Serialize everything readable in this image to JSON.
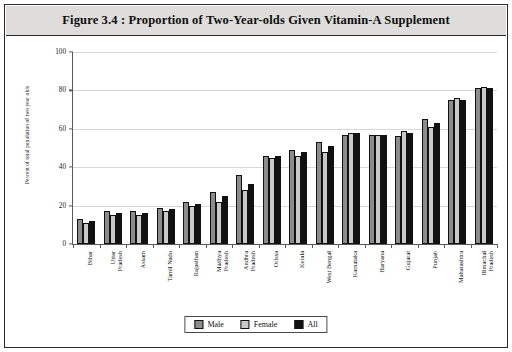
{
  "figure": {
    "title": "Figure 3.4 : Proportion of Two-Year-olds Given Vitamin-A Supplement"
  },
  "legend": {
    "items": [
      {
        "label": "Male",
        "color": "#8c8c8c",
        "key": "male"
      },
      {
        "label": "Female",
        "color": "#c9c9c9",
        "key": "female"
      },
      {
        "label": "All",
        "color": "#111111",
        "key": "all"
      }
    ]
  },
  "chart_data": {
    "type": "bar",
    "title": "Figure 3.4 : Proportion of Two-Year-olds Given Vitamin-A Supplement",
    "xlabel": "",
    "ylabel": "Percent of total population of two year olds",
    "ylim": [
      0,
      100
    ],
    "yticks": [
      0,
      20,
      40,
      60,
      80,
      100
    ],
    "grid": true,
    "legend_position": "bottom-center",
    "categories": [
      "Bihar",
      "Uttar Pradesh",
      "Assam",
      "Tamil Nadu",
      "Rajasthan",
      "Madhya Pradesh",
      "Andhra Pradesh",
      "Orissa",
      "Kerala",
      "West Bengal",
      "Karnataka",
      "Haryana",
      "Gujarat",
      "Punjab",
      "Maharashtra",
      "Himachal Pradesh"
    ],
    "category_lines": [
      [
        "Bihar"
      ],
      [
        "Uttar",
        "Pradesh"
      ],
      [
        "Assam"
      ],
      [
        "Tamil Nadu"
      ],
      [
        "Rajasthan"
      ],
      [
        "Madhya",
        "Pradesh"
      ],
      [
        "Andhra",
        "Pradesh"
      ],
      [
        "Orissa"
      ],
      [
        "Kerala"
      ],
      [
        "West Bengal"
      ],
      [
        "Karnataka"
      ],
      [
        "Haryana"
      ],
      [
        "Gujarat"
      ],
      [
        "Punjab"
      ],
      [
        "Maharashtra"
      ],
      [
        "Himachal",
        "Pradesh"
      ]
    ],
    "series": [
      {
        "name": "Male",
        "color": "#8c8c8c",
        "values": [
          13,
          17,
          17,
          19,
          22,
          27,
          36,
          46,
          49,
          53,
          57,
          57,
          56,
          65,
          75,
          81
        ]
      },
      {
        "name": "Female",
        "color": "#c9c9c9",
        "values": [
          11,
          15,
          15,
          17,
          20,
          22,
          28,
          45,
          46,
          48,
          58,
          57,
          59,
          61,
          76,
          82
        ]
      },
      {
        "name": "All",
        "color": "#111111",
        "values": [
          12,
          16,
          16,
          18,
          21,
          25,
          31,
          46,
          48,
          51,
          58,
          57,
          58,
          63,
          75,
          81
        ]
      }
    ]
  }
}
